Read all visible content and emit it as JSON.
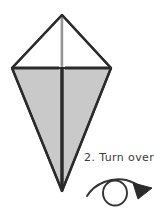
{
  "figure": {
    "background_color": "#ffffff",
    "outline_color": "#2b2b2b",
    "fill_gray": "#c9c9c9",
    "fill_white": "#ffffff",
    "crease_line_color": "#c0c0c0",
    "center_fold_color": "#2b2b2b"
  },
  "model": {
    "shape_name": "kite-base",
    "apex": {
      "x": 62,
      "y": 15
    },
    "left_point": {
      "x": 12,
      "y": 68
    },
    "right_point": {
      "x": 111,
      "y": 68
    },
    "bottom_tip": {
      "x": 62,
      "y": 191
    },
    "center_x": 62,
    "panels": [
      {
        "name": "upper-left-flap",
        "fill": "#ffffff"
      },
      {
        "name": "upper-right-flap",
        "fill": "#ffffff"
      },
      {
        "name": "lower-left-flap",
        "fill": "#c9c9c9"
      },
      {
        "name": "lower-right-flap",
        "fill": "#c9c9c9"
      }
    ]
  },
  "instruction": {
    "step_number": "2.",
    "text": "2. Turn over.",
    "symbol_name": "turn-over-arrow"
  },
  "turn_over_symbol": {
    "circle": {
      "cx": 115,
      "cy": 193,
      "rx": 12,
      "ry": 12.5
    },
    "arc_start": {
      "x": 87,
      "y": 195
    },
    "arrow_tip": {
      "x": 150,
      "y": 192
    },
    "stroke_color": "#333333"
  }
}
